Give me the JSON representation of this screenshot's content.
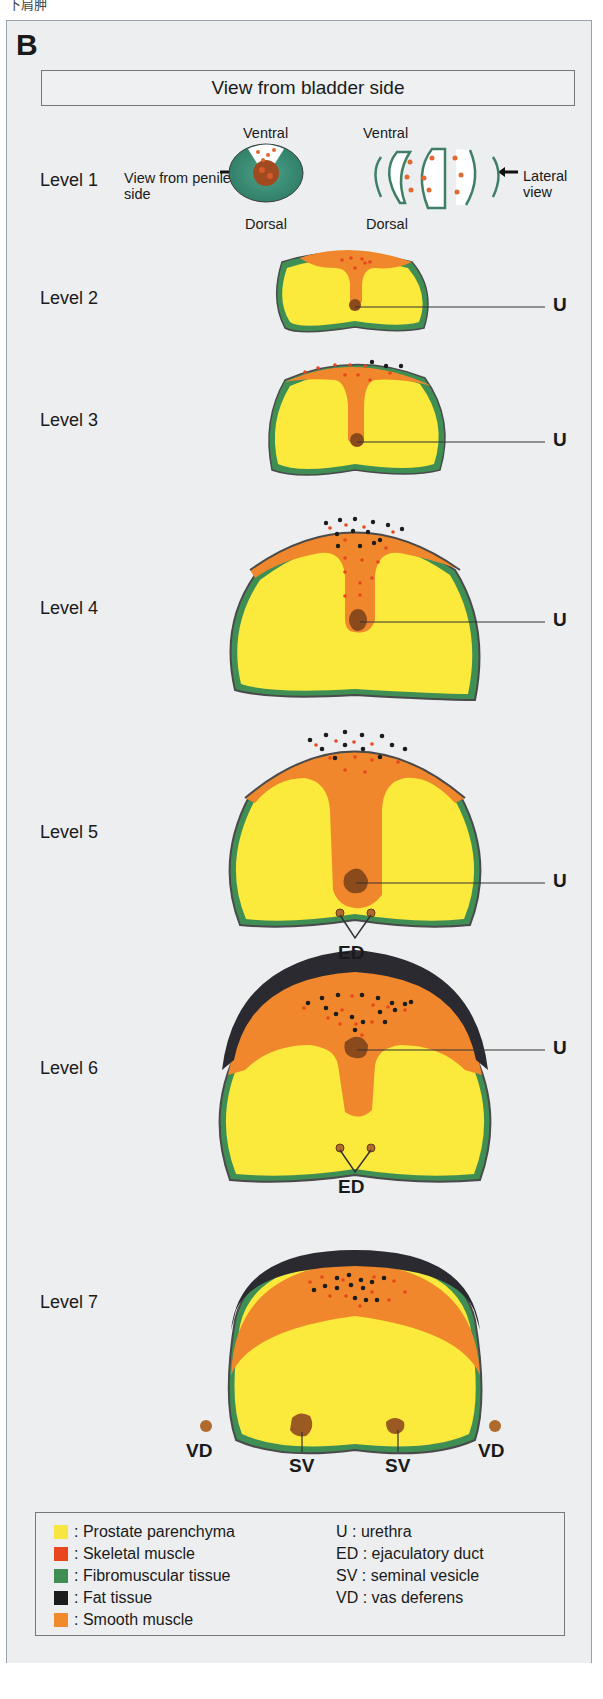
{
  "corner_text": "下肩胛",
  "figure": {
    "panel_label": "B",
    "title": "View from bladder side",
    "level1": {
      "label": "Level 1",
      "penile_view_label": "View from penile side",
      "lateral_view_label": "Lateral view",
      "ventral_left": "Ventral",
      "ventral_right": "Ventral",
      "dorsal_left": "Dorsal",
      "dorsal_right": "Dorsal"
    },
    "levels": [
      {
        "label": "Level 2",
        "structures": [
          "U"
        ]
      },
      {
        "label": "Level 3",
        "structures": [
          "U"
        ]
      },
      {
        "label": "Level 4",
        "structures": [
          "U"
        ]
      },
      {
        "label": "Level 5",
        "structures": [
          "U",
          "ED"
        ]
      },
      {
        "label": "Level 6",
        "structures": [
          "U",
          "ED"
        ]
      },
      {
        "label": "Level 7",
        "structures": [
          "VD",
          "SV",
          "SV",
          "VD"
        ]
      }
    ],
    "annotations": {
      "urethra": "U",
      "ejaculatory_duct": "ED",
      "seminal_vesicle": "SV",
      "vas_deferens": "VD"
    }
  },
  "legend": {
    "tissues": [
      {
        "label": ": Prostate parenchyma",
        "color": "#f7e640"
      },
      {
        "label": ": Skeletal muscle",
        "color": "#e8461c"
      },
      {
        "label": ": Fibromuscular tissue",
        "color": "#3f8f55"
      },
      {
        "label": ": Fat tissue",
        "color": "#1c1c1c"
      },
      {
        "label": ": Smooth muscle",
        "color": "#f08a2a"
      }
    ],
    "abbreviations": [
      {
        "label": "U : urethra"
      },
      {
        "label": "ED : ejaculatory duct"
      },
      {
        "label": "SV : seminal vesicle"
      },
      {
        "label": "VD : vas deferens"
      }
    ]
  },
  "colors": {
    "parenchyma": "#fbe93c",
    "smooth_muscle": "#f0872c",
    "skeletal_muscle": "#e8461c",
    "fibromuscular": "#3f8f55",
    "fat": "#2a2a30",
    "urethra": "#8a4a1c",
    "background": "#eceef0"
  }
}
